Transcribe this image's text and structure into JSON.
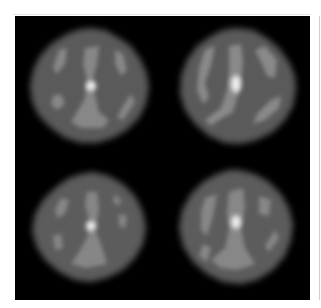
{
  "figure": {
    "layout": "2x2 grid",
    "background": "#000000",
    "page_background": "#ffffff",
    "panels": [
      {
        "position": "top-left",
        "cx": 74,
        "cy": 70,
        "r": 58,
        "hotspot": {
          "x": 76,
          "y": 70
        }
      },
      {
        "position": "top-right",
        "cx": 221,
        "cy": 70,
        "r": 58,
        "hotspot": {
          "x": 221,
          "y": 70
        }
      },
      {
        "position": "bottom-left",
        "cx": 75,
        "cy": 213,
        "r": 58,
        "hotspot": {
          "x": 76,
          "y": 210
        }
      },
      {
        "position": "bottom-right",
        "cx": 221,
        "cy": 213,
        "r": 58,
        "hotspot": {
          "x": 221,
          "y": 208
        }
      }
    ],
    "colors": {
      "disc": "#5e5e5e",
      "structure": "#8a8a8a",
      "hotspot": "#f2f2f2"
    }
  }
}
